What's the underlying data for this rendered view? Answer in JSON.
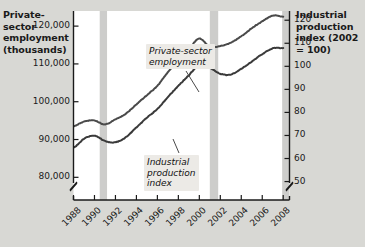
{
  "chart_data": {
    "type": "line",
    "title": "",
    "xlabel": "",
    "ylabel": "Private-sector employment (thousands)",
    "ylabel_right": "Industrial production index (2002 = 100)",
    "grid": false,
    "legend": "annotations-inline",
    "x": [
      1988,
      1989,
      1990,
      1991,
      1992,
      1993,
      1994,
      1995,
      1996,
      1997,
      1998,
      1999,
      2000,
      2001,
      2002,
      2003,
      2004,
      2005,
      2006,
      2007,
      2008
    ],
    "xlim": [
      1988,
      2008.6
    ],
    "xtick_labels": [
      "1988",
      "1990",
      "1992",
      "1994",
      "1996",
      "1998",
      "2000",
      "2002",
      "2004",
      "2006",
      "2008"
    ],
    "left_axis": {
      "ticks": [
        80000,
        90000,
        100000,
        110000,
        120000
      ],
      "tick_labels": [
        "80,000",
        "90,000",
        "100,000",
        "110,000",
        "120,000"
      ],
      "ylim": [
        74000,
        124000
      ],
      "axis_break": true
    },
    "right_axis": {
      "ticks": [
        50,
        60,
        70,
        80,
        90,
        100,
        110,
        120
      ],
      "tick_labels": [
        "50",
        "60",
        "70",
        "80",
        "90",
        "100",
        "110",
        "120"
      ],
      "ylim": [
        42,
        124
      ],
      "axis_break": true
    },
    "series": [
      {
        "name": "Private-sector employment",
        "axis": "left",
        "color": "#3a3a3a",
        "values": [
          87800,
          90200,
          91000,
          89600,
          89300,
          90600,
          93200,
          95800,
          98100,
          101200,
          104200,
          107000,
          109800,
          109000,
          107400,
          107200,
          108700,
          110600,
          112600,
          114100,
          114200
        ]
      },
      {
        "name": "Industrial production index",
        "axis": "right",
        "color": "#4a4a4a",
        "values": [
          74.0,
          76.0,
          76.5,
          74.8,
          77.0,
          79.5,
          83.5,
          87.5,
          91.5,
          97.5,
          103.0,
          107.5,
          112.0,
          108.5,
          108.8,
          110.2,
          113.0,
          116.5,
          119.5,
          122.0,
          121.5
        ]
      }
    ],
    "recession_bands": [
      {
        "label": "1990-91 recession",
        "start": 1990.5,
        "end": 1991.2
      },
      {
        "label": "2001 recession",
        "start": 2001.0,
        "end": 2001.8
      },
      {
        "label": "2007-08 recession",
        "start": 2007.9,
        "end": 2008.6
      }
    ],
    "annotations": [
      {
        "name": "employment-callout",
        "text_line1": "Private-sector",
        "text_line2": "employment"
      },
      {
        "name": "ipi-callout",
        "text_line1": "Industrial",
        "text_line2": "production",
        "text_line3": "index"
      }
    ],
    "colors": {
      "background": "#d8d8d4",
      "plot_background": "#ffffff",
      "recession_band": "#cdcdcb",
      "axis": "#1a1a1a",
      "callout_background": "#eceae6"
    }
  }
}
